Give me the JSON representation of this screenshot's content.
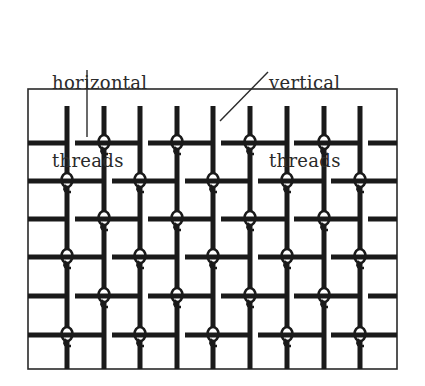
{
  "labels": {
    "horizontal": {
      "line1": "horizontal",
      "line2": "threads",
      "x": 52,
      "y": 18
    },
    "vertical": {
      "line1": "vertical",
      "line2": "threads",
      "x": 269,
      "y": 18
    }
  },
  "colors": {
    "thread": "#1a1a1a",
    "frame": "#2a2a2a",
    "leader": "#2a2a2a",
    "background": "#ffffff"
  },
  "frame": {
    "x": 28,
    "y": 89,
    "width": 369,
    "height": 280
  },
  "leaders": [
    {
      "name": "horizontal-threads-leader",
      "x1": 87,
      "y1": 70,
      "x2": 87,
      "y2": 137
    },
    {
      "name": "vertical-threads-leader",
      "x1": 268,
      "y1": 72,
      "x2": 220,
      "y2": 121
    }
  ],
  "vertical_threads": {
    "x": [
      67,
      104,
      140,
      177,
      213,
      250,
      287,
      324,
      360
    ],
    "y_top": 106,
    "y_bottom": 369
  },
  "horizontal_rows": {
    "y": [
      143,
      181,
      219,
      257,
      296,
      335
    ],
    "odd_pattern": {
      "segments": [
        [
          28,
          67
        ],
        [
          75,
          140
        ],
        [
          148,
          213
        ],
        [
          221,
          287
        ],
        [
          294,
          360
        ],
        [
          368,
          397
        ]
      ],
      "loops": [
        104,
        177,
        250,
        324
      ]
    },
    "even_pattern": {
      "segments": [
        [
          28,
          104
        ],
        [
          112,
          177
        ],
        [
          185,
          250
        ],
        [
          258,
          324
        ],
        [
          331,
          397
        ]
      ],
      "loops": [
        67,
        140,
        213,
        287,
        360
      ]
    }
  }
}
